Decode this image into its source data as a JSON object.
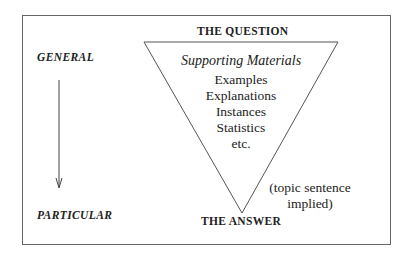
{
  "diagram": {
    "top_label": "THE QUESTION",
    "bottom_label": "THE ANSWER",
    "left_top_label": "GENERAL",
    "left_bottom_label": "PARTICULAR",
    "triangle": {
      "heading": "Supporting Materials",
      "items": [
        "Examples",
        "Explanations",
        "Instances",
        "Statistics",
        "etc."
      ]
    },
    "note_line1": "(topic sentence",
    "note_line2": "implied)",
    "arrow_direction": "down",
    "colors": {
      "line": "#555555",
      "text": "#222222",
      "background": "#ffffff"
    }
  }
}
